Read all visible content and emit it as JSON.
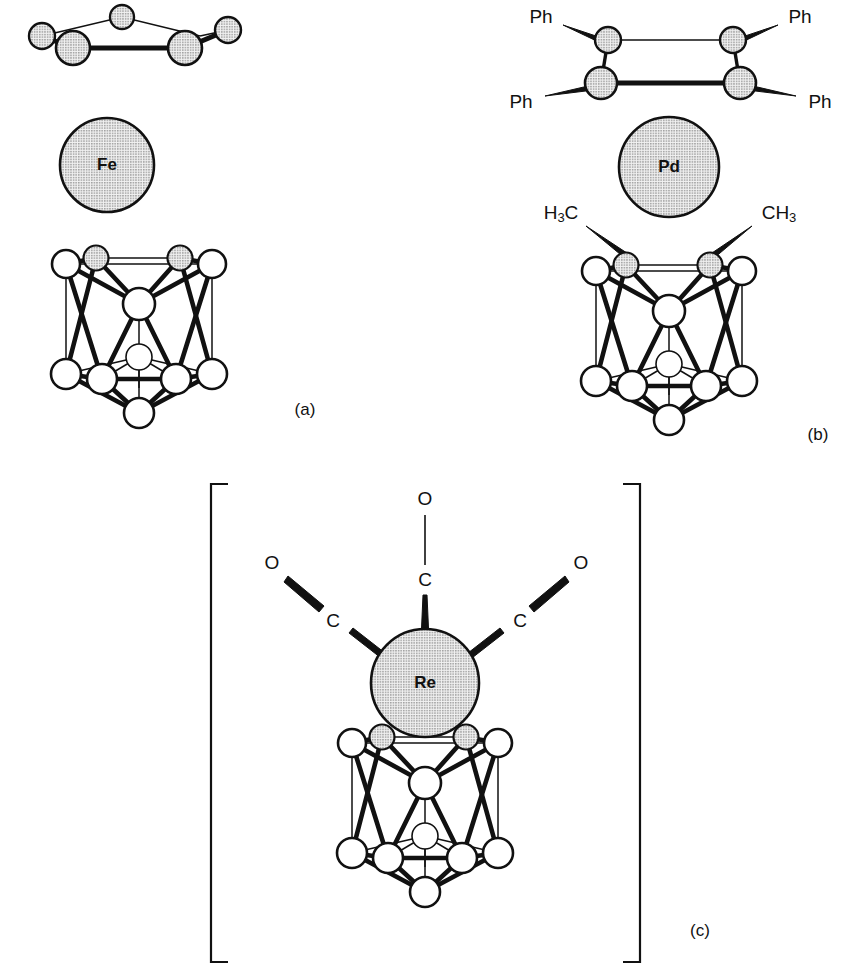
{
  "figure": {
    "background": "#ffffff",
    "ink": "#111111",
    "stipple_fill": "#d6d6d6",
    "open_fill": "#ffffff",
    "panels": [
      {
        "id": "a",
        "label": "(a)",
        "metal_label": "Fe",
        "ligand_labels": [],
        "fragment_type": "planar-chain",
        "cluster_type": "icosahedral-cage"
      },
      {
        "id": "b",
        "label": "(b)",
        "metal_label": "Pd",
        "ligand_labels": [
          "Ph",
          "Ph",
          "Ph",
          "Ph"
        ],
        "cage_substituents": [
          {
            "stem": "H",
            "sub": "3",
            "tail": "C",
            "order": "sub-first"
          },
          {
            "stem": "CH",
            "sub": "3",
            "tail": "",
            "order": "sub-last"
          }
        ],
        "fragment_type": "planar-ring",
        "cluster_type": "icosahedral-cage"
      },
      {
        "id": "c",
        "label": "(c)",
        "metal_label": "Re",
        "ligand_labels": [
          "C",
          "O",
          "C",
          "O",
          "C",
          "O"
        ],
        "carbonyls": [
          {
            "carbon": "C",
            "oxygen": "O",
            "position": "left"
          },
          {
            "carbon": "C",
            "oxygen": "O",
            "position": "top"
          },
          {
            "carbon": "C",
            "oxygen": "O",
            "position": "right"
          }
        ],
        "bracketed": true,
        "cluster_type": "icosahedral-cage"
      }
    ]
  }
}
